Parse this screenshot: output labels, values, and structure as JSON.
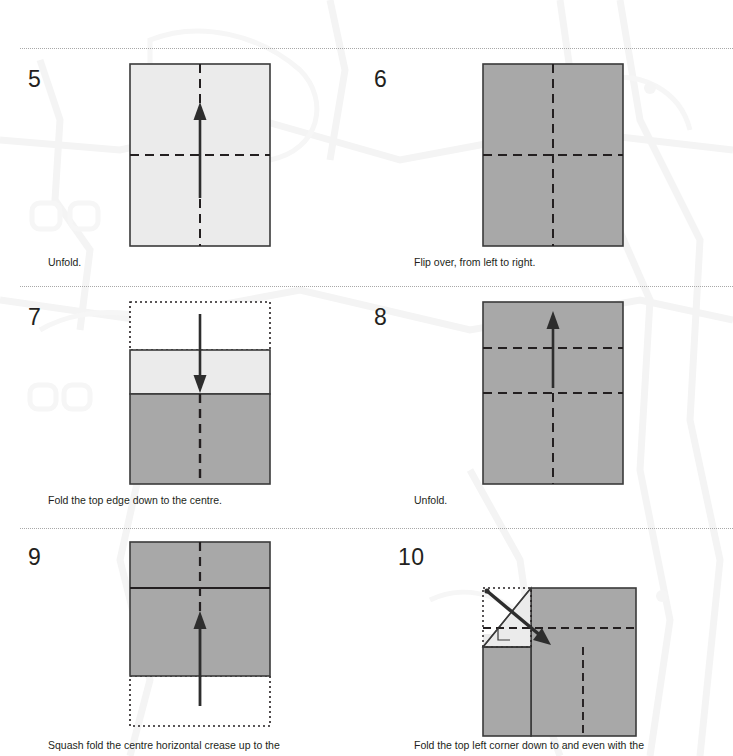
{
  "document": {
    "kind": "origami-instruction-sheet",
    "page_width": 733,
    "page_height": 756,
    "background_color": "#ffffff",
    "watermark": "faint-map-outline"
  },
  "palette": {
    "ink": "#231f20",
    "paper_light": "#ebebeb",
    "paper_mid": "#e4e4e4",
    "paper_dark": "#a8a8a8",
    "outline": "#3a3a3a",
    "rule": "#9a9a9a"
  },
  "steps": [
    {
      "number": "5",
      "caption": "Unfold.",
      "figure": "rect-light-cross-creases-up-arrow"
    },
    {
      "number": "6",
      "caption": "Flip over, from left to right.",
      "figure": "rect-dark-cross-creases"
    },
    {
      "number": "7",
      "caption": "Fold the top edge down to the centre.",
      "figure": "dotted-top-light-band-dark-bottom-down-arrow"
    },
    {
      "number": "8",
      "caption": "Unfold.",
      "figure": "rect-dark-two-horizontal-creases-up-arrow"
    },
    {
      "number": "9",
      "caption": "Squash fold the centre horizontal crease up to the",
      "figure": "square-dark-solid-line-dotted-box-below-up-arrow"
    },
    {
      "number": "10",
      "caption": "Fold the top left corner down to and even with the",
      "figure": "corner-fold-diagonal-light-triangle-dotted-box"
    }
  ],
  "rules": {
    "count": 3,
    "y_positions": [
      48,
      286,
      528
    ]
  }
}
